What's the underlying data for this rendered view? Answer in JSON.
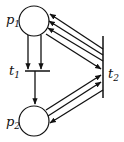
{
  "diagram": {
    "type": "petri-net",
    "places": [
      {
        "id": "p1",
        "label": "p",
        "sub": "1"
      },
      {
        "id": "p2",
        "label": "p",
        "sub": "2"
      }
    ],
    "transitions": [
      {
        "id": "t1",
        "label": "t",
        "sub": "1"
      },
      {
        "id": "t2",
        "label": "t",
        "sub": "2"
      }
    ],
    "arcs": [
      {
        "from": "p1",
        "to": "t1",
        "count": 2
      },
      {
        "from": "t1",
        "to": "p2",
        "count": 1
      },
      {
        "from": "t2",
        "to": "p1",
        "count": 3
      },
      {
        "from": "p1",
        "to": "t2",
        "count": 1
      },
      {
        "from": "p2",
        "to": "t2",
        "count": 2
      },
      {
        "from": "t2",
        "to": "p2",
        "count": 1
      }
    ],
    "colors": {
      "stroke": "#111111",
      "background": "#ffffff"
    }
  }
}
